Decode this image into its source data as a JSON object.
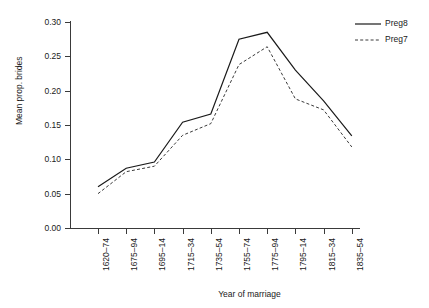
{
  "chart_data": {
    "type": "line",
    "title": "",
    "xlabel": "Year of marriage",
    "ylabel": "Mean prop. brides",
    "categories": [
      "1620–74",
      "1675–94",
      "1695–14",
      "1715–34",
      "1735–54",
      "1755–74",
      "1775–94",
      "1795–14",
      "1815–34",
      "1835–54"
    ],
    "ylim": [
      0.0,
      0.3
    ],
    "yticks": [
      0.0,
      0.05,
      0.1,
      0.15,
      0.2,
      0.25,
      0.3
    ],
    "ytick_labels": [
      "0.00",
      "0.05",
      "0.10",
      "0.15",
      "0.20",
      "0.25",
      "0.30"
    ],
    "grid": false,
    "legend_position": "top-right",
    "series": [
      {
        "name": "Preg8",
        "style": "solid",
        "color": "#1a1a1a",
        "values": [
          0.06,
          0.087,
          0.096,
          0.154,
          0.166,
          0.275,
          0.285,
          0.23,
          0.185,
          0.134
        ]
      },
      {
        "name": "Preg7",
        "style": "dashed",
        "color": "#3a3a3a",
        "values": [
          0.05,
          0.082,
          0.09,
          0.135,
          0.152,
          0.238,
          0.264,
          0.188,
          0.172,
          0.118
        ]
      }
    ]
  },
  "legend": {
    "entries": [
      {
        "label": "Preg8"
      },
      {
        "label": "Preg7"
      }
    ]
  }
}
